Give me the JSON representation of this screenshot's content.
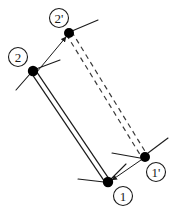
{
  "figure": {
    "background_color": "#ffffff",
    "line_color": "#1a1a1a",
    "node_fill_color": "#000000",
    "dashed_color": "#3a3a3a"
  },
  "nodes": [
    {
      "id": "node-1",
      "label": "1",
      "label_name": "node-label-1",
      "x": 108,
      "y": 182,
      "radius": 5.2,
      "label_cx": 123,
      "label_cy": 196,
      "label_r": 9.5,
      "state": "original"
    },
    {
      "id": "node-2",
      "label": "2",
      "label_name": "node-label-2",
      "x": 33,
      "y": 71,
      "radius": 5.2,
      "label_cx": 18,
      "label_cy": 57,
      "label_r": 9.5,
      "state": "original"
    },
    {
      "id": "node-1-prime",
      "label": "1'",
      "label_name": "node-label-1-prime",
      "x": 145,
      "y": 157,
      "radius": 5.0,
      "label_cx": 156,
      "label_cy": 172,
      "label_r": 9.5,
      "state": "displaced"
    },
    {
      "id": "node-2-prime",
      "label": "2'",
      "label_name": "node-label-2-prime",
      "x": 69,
      "y": 33,
      "radius": 5.0,
      "label_cx": 59,
      "label_cy": 18,
      "label_r": 9.5,
      "state": "displaced"
    }
  ],
  "members": [
    {
      "id": "member-original",
      "name": "original-element-double-line",
      "style": "solid-double",
      "from": "node-2",
      "to": "node-1",
      "offset": 2.6,
      "stroke_width": 1.2
    },
    {
      "id": "member-displaced",
      "name": "displaced-element-double-dashed-line",
      "style": "dashed-double",
      "from": "node-2-prime",
      "to": "node-1-prime",
      "offset": 3.0,
      "stroke_width": 1.2,
      "dash_pattern": "5,4"
    }
  ],
  "arrows": [
    {
      "id": "arrow-2-to-2prime",
      "name": "displacement-arrow-node-2",
      "x1": 36,
      "y1": 73,
      "x2": 66,
      "y2": 37,
      "stroke_width": 1.0
    },
    {
      "id": "arrow-1prime-to-1",
      "name": "displacement-arrow-node-1",
      "x1": 141,
      "y1": 160,
      "x2": 112,
      "y2": 180,
      "stroke_width": 1.0
    }
  ],
  "tangent_marks": [
    {
      "id": "tangent-2-upper",
      "name": "tangent-mark-node-2-upper",
      "x1": 36,
      "y1": 69,
      "x2": 60,
      "y2": 60
    },
    {
      "id": "tangent-2-lower",
      "name": "tangent-mark-node-2-lower",
      "x1": 30,
      "y1": 74,
      "x2": 16,
      "y2": 90
    },
    {
      "id": "tangent-2prime",
      "name": "tangent-mark-node-2-prime",
      "x1": 72,
      "y1": 31,
      "x2": 98,
      "y2": 20
    },
    {
      "id": "tangent-1-left",
      "name": "tangent-mark-node-1-left",
      "x1": 104,
      "y1": 182,
      "x2": 78,
      "y2": 179
    },
    {
      "id": "tangent-1-upper",
      "name": "tangent-mark-node-1-upper",
      "x1": 111,
      "y1": 179,
      "x2": 126,
      "y2": 164
    },
    {
      "id": "tangent-1prime-left",
      "name": "tangent-mark-node-1-prime-left",
      "x1": 140,
      "y1": 158,
      "x2": 112,
      "y2": 153
    },
    {
      "id": "tangent-1prime-upper",
      "name": "tangent-mark-node-1-prime-upper",
      "x1": 148,
      "y1": 153,
      "x2": 168,
      "y2": 138
    }
  ],
  "legend": {
    "original_state_label": "original position",
    "displaced_state_label": "displaced position"
  }
}
